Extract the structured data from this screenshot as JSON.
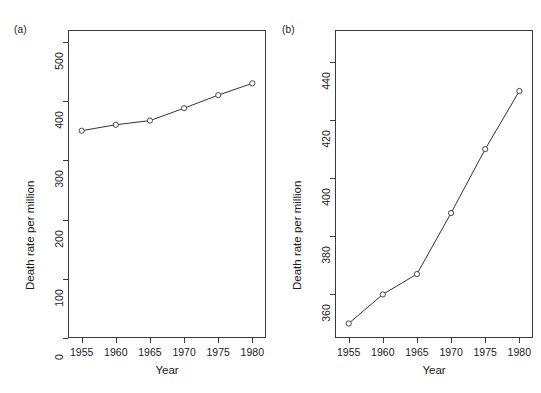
{
  "figure": {
    "panels": [
      {
        "tag": "(a)",
        "xlabel": "Year",
        "ylabel": "Death rate per million",
        "xticks": [
          "1955",
          "1960",
          "1965",
          "1970",
          "1975",
          "1980"
        ],
        "yticks": [
          "0",
          "100",
          "200",
          "300",
          "400",
          "500"
        ]
      },
      {
        "tag": "(b)",
        "xlabel": "Year",
        "ylabel": "Death rate per million",
        "xticks": [
          "1955",
          "1960",
          "1965",
          "1970",
          "1975",
          "1980"
        ],
        "yticks": [
          "360",
          "380",
          "400",
          "420",
          "440"
        ]
      }
    ]
  },
  "chart_data": [
    {
      "type": "line",
      "title": "(a)",
      "xlabel": "Year",
      "ylabel": "Death rate per million",
      "x": [
        1955,
        1960,
        1965,
        1970,
        1975,
        1980
      ],
      "values": [
        350,
        360,
        367,
        388,
        410,
        430
      ],
      "xlim": [
        1953,
        1982
      ],
      "ylim": [
        0,
        520
      ],
      "xticks": [
        1955,
        1960,
        1965,
        1970,
        1975,
        1980
      ],
      "yticks": [
        0,
        100,
        200,
        300,
        400,
        500
      ],
      "grid": false,
      "legend": "none",
      "marker": "open-circle",
      "line_color": "#333333"
    },
    {
      "type": "line",
      "title": "(b)",
      "xlabel": "Year",
      "ylabel": "Death rate per million",
      "x": [
        1955,
        1960,
        1965,
        1970,
        1975,
        1980
      ],
      "values": [
        350,
        360,
        367,
        388,
        410,
        430
      ],
      "xlim": [
        1953,
        1982
      ],
      "ylim": [
        345,
        451
      ],
      "xticks": [
        1955,
        1960,
        1965,
        1970,
        1975,
        1980
      ],
      "yticks": [
        360,
        380,
        400,
        420,
        440
      ],
      "grid": false,
      "legend": "none",
      "marker": "open-circle",
      "line_color": "#333333"
    }
  ],
  "style": {
    "axis_color": "#3a3a3a",
    "text_color": "#1a1a1a",
    "background": "#ffffff"
  }
}
